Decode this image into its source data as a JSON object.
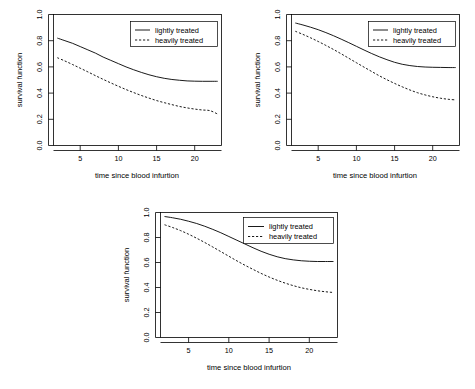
{
  "figure": {
    "panel_count": 3,
    "layout": "two-on-top-one-below",
    "background_color": "#ffffff",
    "line_color": "#000000"
  },
  "shared": {
    "xlabel": "time since blood infurtion",
    "ylabel": "survival function",
    "xticks": [
      "5",
      "10",
      "15",
      "20"
    ],
    "xtick_values": [
      5,
      10,
      15,
      20
    ],
    "yticks": [
      "0.0",
      "0.2",
      "0.4",
      "0.6",
      "0.8",
      "1.0"
    ],
    "ytick_values": [
      0.0,
      0.2,
      0.4,
      0.6,
      0.8,
      1.0
    ],
    "legend": {
      "entries": [
        {
          "label": "lightly treated",
          "style": "solid"
        },
        {
          "label": "heavily treated",
          "style": "dashed"
        }
      ],
      "position": "top-right"
    }
  },
  "chart_data": [
    {
      "type": "line",
      "panel": "top-left",
      "title": "",
      "xlabel": "time since blood infurtion",
      "ylabel": "survival function",
      "xlim": [
        1.5,
        23.5
      ],
      "ylim": [
        0.0,
        1.0
      ],
      "grid": false,
      "legend_position": "top-right",
      "x": [
        2,
        3,
        4,
        5,
        6,
        7,
        8,
        9,
        10,
        11,
        12,
        13,
        14,
        15,
        16,
        17,
        18,
        19,
        20,
        21,
        22,
        23
      ],
      "series": [
        {
          "name": "lightly treated",
          "style": "solid",
          "values": [
            0.82,
            0.8,
            0.78,
            0.755,
            0.73,
            0.705,
            0.675,
            0.65,
            0.625,
            0.6,
            0.578,
            0.558,
            0.54,
            0.525,
            0.513,
            0.504,
            0.498,
            0.493,
            0.491,
            0.49,
            0.49,
            0.49
          ]
        },
        {
          "name": "heavily treated",
          "style": "dashed",
          "values": [
            0.67,
            0.645,
            0.618,
            0.59,
            0.562,
            0.533,
            0.505,
            0.478,
            0.452,
            0.427,
            0.404,
            0.382,
            0.362,
            0.343,
            0.327,
            0.312,
            0.298,
            0.287,
            0.278,
            0.271,
            0.266,
            0.24
          ]
        }
      ]
    },
    {
      "type": "line",
      "panel": "top-right",
      "title": "",
      "xlabel": "time since blood infurtion",
      "ylabel": "survival function",
      "xlim": [
        1.5,
        23.5
      ],
      "ylim": [
        0.0,
        1.0
      ],
      "grid": false,
      "legend_position": "top-right",
      "x": [
        2,
        3,
        4,
        5,
        6,
        7,
        8,
        9,
        10,
        11,
        12,
        13,
        14,
        15,
        16,
        17,
        18,
        19,
        20,
        21,
        22,
        23
      ],
      "series": [
        {
          "name": "lightly treated",
          "style": "solid",
          "values": [
            0.935,
            0.92,
            0.903,
            0.884,
            0.862,
            0.838,
            0.812,
            0.785,
            0.757,
            0.729,
            0.702,
            0.677,
            0.655,
            0.635,
            0.62,
            0.61,
            0.603,
            0.599,
            0.597,
            0.596,
            0.595,
            0.595
          ]
        },
        {
          "name": "heavily treated",
          "style": "dashed",
          "values": [
            0.872,
            0.848,
            0.822,
            0.794,
            0.764,
            0.733,
            0.7,
            0.666,
            0.632,
            0.598,
            0.565,
            0.532,
            0.502,
            0.474,
            0.448,
            0.424,
            0.403,
            0.386,
            0.372,
            0.361,
            0.353,
            0.348
          ]
        }
      ]
    },
    {
      "type": "line",
      "panel": "bottom-center",
      "title": "",
      "xlabel": "time since blood infurtion",
      "ylabel": "survival function",
      "xlim": [
        1.5,
        23.5
      ],
      "ylim": [
        0.0,
        1.0
      ],
      "grid": false,
      "legend_position": "top-right",
      "x": [
        2,
        3,
        4,
        5,
        6,
        7,
        8,
        9,
        10,
        11,
        12,
        13,
        14,
        15,
        16,
        17,
        18,
        19,
        20,
        21,
        22,
        23
      ],
      "series": [
        {
          "name": "lightly treated",
          "style": "solid",
          "values": [
            0.968,
            0.958,
            0.946,
            0.93,
            0.912,
            0.89,
            0.865,
            0.838,
            0.808,
            0.778,
            0.748,
            0.718,
            0.69,
            0.666,
            0.646,
            0.631,
            0.621,
            0.614,
            0.61,
            0.608,
            0.608,
            0.608
          ]
        },
        {
          "name": "heavily treated",
          "style": "dashed",
          "values": [
            0.902,
            0.88,
            0.855,
            0.826,
            0.794,
            0.76,
            0.724,
            0.687,
            0.65,
            0.613,
            0.578,
            0.545,
            0.513,
            0.484,
            0.458,
            0.435,
            0.415,
            0.398,
            0.385,
            0.374,
            0.366,
            0.36
          ]
        }
      ]
    }
  ]
}
